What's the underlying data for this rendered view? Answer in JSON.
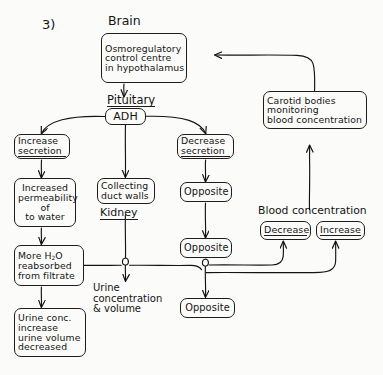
{
  "diagram": {
    "question_number": "3)",
    "title_labels": {
      "brain": "Brain",
      "pituitary": "Pituitary",
      "kidney": "Kidney",
      "blood_concentration": "Blood concentration",
      "urine_conc_volume_line1": "Urine",
      "urine_conc_volume_line2": "concentration",
      "urine_conc_volume_line3": "& volume"
    },
    "nodes": {
      "osmoregulatory": {
        "line1": "Osmoregulatory",
        "line2": "control centre",
        "line3": "in hypothalamus"
      },
      "adh": {
        "line1": "ADH"
      },
      "carotid": {
        "line1": "Carotid  bodies",
        "line2": "monitoring",
        "line3": "blood concentration"
      },
      "increase_secretion": {
        "line1": "Increase",
        "line2": "secretion"
      },
      "decrease_secretion": {
        "line1": "Decrease",
        "line2": "secretion"
      },
      "increased_permeability": {
        "line1": "Increased",
        "line2": "permeability",
        "line3": "of",
        "line4": "to  water"
      },
      "collecting_duct": {
        "line1": "Collecting",
        "line2": "duct walls"
      },
      "opposite_right_1": {
        "line1": "Opposite"
      },
      "opposite_right_2": {
        "line1": "Opposite"
      },
      "opposite_bottom": {
        "line1": "Opposite"
      },
      "more_h2o": {
        "line1_a": "More  H",
        "line1_sub": "2",
        "line1_b": "O",
        "line2": "reabsorbed",
        "line3": "from filtrate"
      },
      "urine_result": {
        "line1": "Urine conc.",
        "line2": "increase",
        "line3": "urine volume",
        "line4": "decreased"
      },
      "bc_decrease": {
        "line1": "Decrease"
      },
      "bc_increase": {
        "line1": "Increase"
      }
    },
    "colors": {
      "ink": "#141414",
      "paper": "#fbfbf9"
    }
  }
}
